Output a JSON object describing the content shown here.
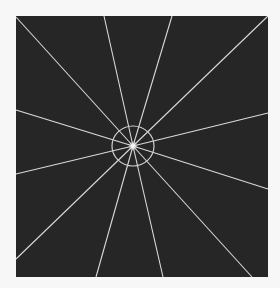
{
  "figure": {
    "background_color": "#f7f7f7",
    "panel": {
      "x": 16,
      "y": 16,
      "width": 252,
      "height": 261,
      "color": "#262626"
    },
    "line_color": "#d9d9d9",
    "center": {
      "x": 133,
      "y": 146
    },
    "circle": {
      "rx": 21,
      "ry": 20,
      "color": "#cfcfcf"
    },
    "rays": [
      {
        "x": 16,
        "y": 17
      },
      {
        "x": 104,
        "y": 16
      },
      {
        "x": 172,
        "y": 16
      },
      {
        "x": 268,
        "y": 16
      },
      {
        "x": 268,
        "y": 113
      },
      {
        "x": 268,
        "y": 189
      },
      {
        "x": 252,
        "y": 277
      },
      {
        "x": 163,
        "y": 277
      },
      {
        "x": 96,
        "y": 277
      },
      {
        "x": 16,
        "y": 259
      },
      {
        "x": 16,
        "y": 174
      },
      {
        "x": 16,
        "y": 110
      }
    ]
  }
}
